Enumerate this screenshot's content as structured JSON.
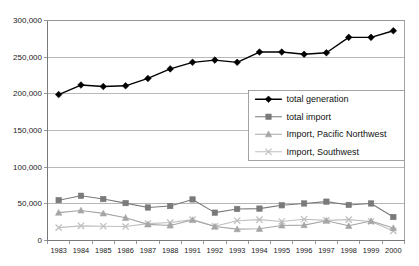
{
  "chart_data": {
    "type": "line",
    "title": "",
    "xlabel": "",
    "ylabel": "",
    "ylim": [
      0,
      300000
    ],
    "grid": true,
    "legend_position": "center-right",
    "categories": [
      "1983",
      "1984",
      "1985",
      "1986",
      "1987",
      "1988",
      "1991",
      "1992",
      "1993",
      "1994",
      "1995",
      "1996",
      "1997",
      "1998",
      "1999",
      "2000"
    ],
    "ytick_labels": [
      "0",
      "50,000",
      "100,000",
      "150,000",
      "200,000",
      "250,000",
      "300,000"
    ],
    "ytick_values": [
      0,
      50000,
      100000,
      150000,
      200000,
      250000,
      300000
    ],
    "series": [
      {
        "name": "total generation",
        "marker": "diamond",
        "color": "#000000",
        "values": [
          199000,
          212000,
          210000,
          211000,
          221000,
          234000,
          243000,
          246000,
          243000,
          257000,
          257000,
          254000,
          256000,
          277000,
          277000,
          286000
        ]
      },
      {
        "name": "total import",
        "marker": "square",
        "color": "#7a7a7a",
        "values": [
          55000,
          61000,
          56500,
          51000,
          45000,
          47000,
          56000,
          38000,
          43000,
          43500,
          48000,
          50500,
          53000,
          48500,
          50500,
          32000
        ]
      },
      {
        "name": "Import, Pacific Northwest",
        "marker": "triangle",
        "color": "#a6a6a6",
        "values": [
          38000,
          41000,
          37000,
          31000,
          22000,
          20500,
          28000,
          19000,
          15500,
          16000,
          20500,
          21000,
          27000,
          20000,
          26500,
          17000
        ]
      },
      {
        "name": "Import, Southwest",
        "marker": "cross",
        "color": "#bfbfbf",
        "values": [
          17500,
          20000,
          19500,
          19000,
          23000,
          24500,
          28500,
          19500,
          27000,
          28500,
          26000,
          29000,
          27500,
          28500,
          26000,
          13000
        ]
      }
    ]
  },
  "legend": {
    "entries": [
      {
        "label": "total generation"
      },
      {
        "label": "total import"
      },
      {
        "label": "Import, Pacific Northwest"
      },
      {
        "label": "Import, Southwest"
      }
    ]
  }
}
